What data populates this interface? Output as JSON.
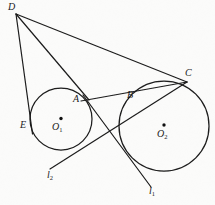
{
  "figure": {
    "kind": "euclidean-geometry-diagram",
    "background_color": "#fbfbfa",
    "stroke_color": "#1a1a1a",
    "label_color": "#1a1a1a"
  },
  "labels": {
    "D": "D",
    "C": "C",
    "A": "A",
    "B": "B",
    "E": "E",
    "O1_main": "O",
    "O1_sub": "1",
    "O2_main": "O",
    "O2_sub": "2",
    "l1_main": "l",
    "l1_sub": "1",
    "l2_main": "l",
    "l2_sub": "2"
  },
  "points": {
    "D": {
      "x": 16,
      "y": 14,
      "label": "D"
    },
    "C": {
      "x": 184,
      "y": 81,
      "label": "C"
    },
    "A": {
      "x": 86,
      "y": 97,
      "label": "A"
    },
    "B": {
      "x": 126,
      "y": 97,
      "label": "B"
    },
    "E": {
      "x": 31,
      "y": 127,
      "label": "E"
    },
    "O1": {
      "x": 61,
      "y": 119,
      "label": "O1"
    },
    "O2": {
      "x": 164,
      "y": 126,
      "label": "O2"
    }
  },
  "circles": [
    {
      "name": "circle-O1",
      "cx": 61,
      "cy": 119,
      "r": 31
    },
    {
      "name": "circle-O2",
      "cx": 164,
      "cy": 126,
      "r": 45
    }
  ],
  "segments": [
    {
      "name": "segment-D-E-tangent",
      "from": "D",
      "to": "E-extended",
      "x1": 16,
      "y1": 14,
      "x2": 32,
      "y2": 133
    },
    {
      "name": "segment-D-A",
      "from": "D",
      "to": "A",
      "x1": 16,
      "y1": 14,
      "x2": 88,
      "y2": 99
    },
    {
      "name": "segment-D-C",
      "from": "D",
      "to": "C",
      "x1": 16,
      "y1": 14,
      "x2": 186,
      "y2": 82
    },
    {
      "name": "segment-A-C",
      "from": "A",
      "to": "C",
      "x1": 82,
      "y1": 100,
      "x2": 186,
      "y2": 82
    },
    {
      "name": "tangent-line-l1",
      "from": "A-side",
      "to": "l1",
      "x1": 84,
      "y1": 96,
      "x2": 150,
      "y2": 186
    },
    {
      "name": "tangent-line-l2",
      "from": "l2",
      "to": "C-side",
      "x1": 51,
      "y1": 168,
      "x2": 186,
      "y2": 82
    }
  ],
  "line_labels": {
    "l1": "l1",
    "l2": "l2"
  }
}
